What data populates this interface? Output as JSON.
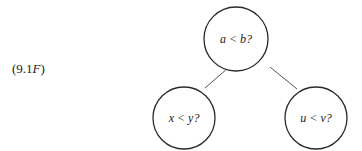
{
  "equation_label": {
    "open": "(9.1",
    "var": "F",
    "close": ")"
  },
  "tree": {
    "root": {
      "label": "a < b?"
    },
    "left": {
      "label": "x < y?"
    },
    "right": {
      "label": "u < v?"
    }
  },
  "colors": {
    "stroke": "#2a2a2a",
    "edge": "#555555",
    "text": "#1a1a1a"
  }
}
